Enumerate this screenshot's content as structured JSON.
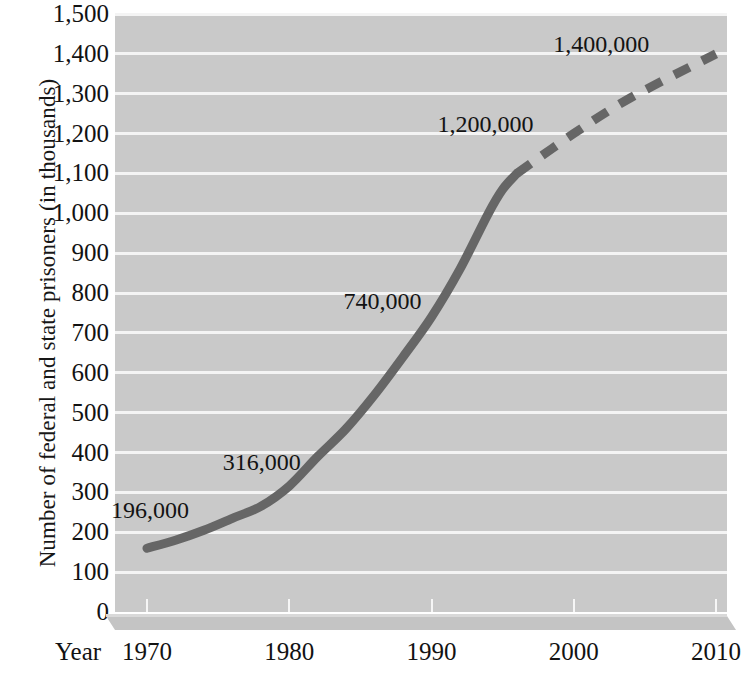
{
  "chart_data": {
    "type": "line",
    "title": "",
    "xlabel": "Year",
    "ylabel": "Number of federal and state prisoners (in thousands)",
    "xlim": [
      1970,
      2010
    ],
    "ylim": [
      0,
      1500
    ],
    "grid": true,
    "legend": "none",
    "x_ticks": [
      "1970",
      "1980",
      "1990",
      "2000",
      "2010"
    ],
    "x_tick_values": [
      1970,
      1980,
      1990,
      2000,
      2010
    ],
    "y_ticks": [
      "0",
      "100",
      "200",
      "300",
      "400",
      "500",
      "600",
      "700",
      "800",
      "900",
      "1,000",
      "1,100",
      "1,200",
      "1,300",
      "1,400",
      "1,500"
    ],
    "y_tick_values": [
      0,
      100,
      200,
      300,
      400,
      500,
      600,
      700,
      800,
      900,
      1000,
      1100,
      1200,
      1300,
      1400,
      1500
    ],
    "series": [
      {
        "name": "Actual (solid)",
        "style": "solid",
        "color": "#666666",
        "x": [
          1970,
          1972,
          1974,
          1976,
          1978,
          1980,
          1982,
          1984,
          1986,
          1988,
          1990,
          1992,
          1994,
          1995,
          1996
        ],
        "values": [
          160,
          180,
          205,
          235,
          265,
          316,
          390,
          460,
          545,
          640,
          740,
          860,
          1000,
          1060,
          1100
        ]
      },
      {
        "name": "Projected (dashed)",
        "style": "dashed",
        "color": "#666666",
        "x": [
          1996,
          2000,
          2004,
          2010
        ],
        "values": [
          1100,
          1200,
          1290,
          1400
        ]
      }
    ],
    "annotations": [
      {
        "text": "196,000",
        "x": 1970,
        "y": 196
      },
      {
        "text": "316,000",
        "x": 1978,
        "y": 316
      },
      {
        "text": "740,000",
        "x": 1990,
        "y": 740
      },
      {
        "text": "1,200,000",
        "x": 1999,
        "y": 1200
      },
      {
        "text": "1,400,000",
        "x": 2007,
        "y": 1400
      }
    ]
  },
  "colors": {
    "plot_background": "#c9c9c9",
    "gridline": "#f4f4f4",
    "line": "#666666",
    "text": "#121212",
    "page_background": "#ffffff",
    "base_slab": "#c4c4c4"
  }
}
